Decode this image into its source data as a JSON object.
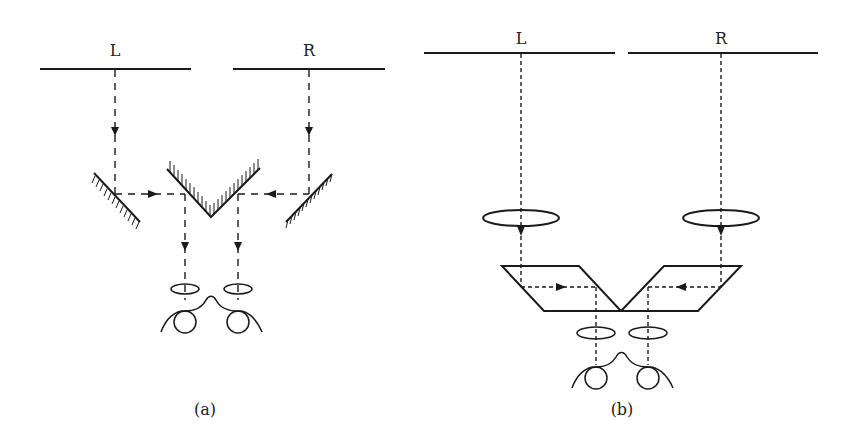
{
  "figure": {
    "panel_a": {
      "caption": "(a)",
      "left_image_label": "L",
      "right_image_label": "R",
      "description": "Mirror stereoscope: two side mirrors and a central V-shaped mirror pair reflect left and right images into eyepieces"
    },
    "panel_b": {
      "caption": "(b)",
      "left_image_label": "L",
      "right_image_label": "R",
      "description": "Lens-prism stereoscope: lenses above rhomboid prisms redirect left and right images into eyepieces"
    }
  },
  "colors": {
    "stroke": "#1a1a1a",
    "background": "#ffffff"
  }
}
